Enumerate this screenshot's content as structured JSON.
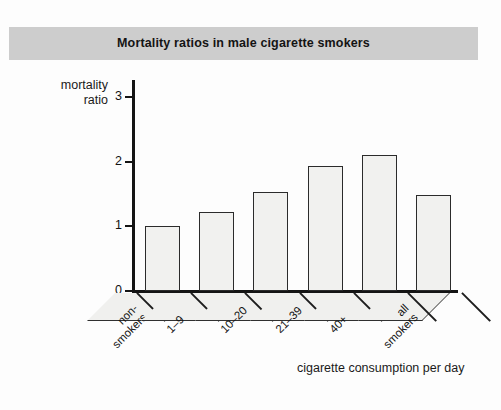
{
  "figure": {
    "title": "Mortality ratios in male cigarette smokers",
    "background_color": "#fdfdfd",
    "title_band_color": "#cdcdcd"
  },
  "chart_data": {
    "type": "bar",
    "title": "Mortality ratios in male cigarette smokers",
    "xlabel": "cigarette consumption per day",
    "ylabel": "mortality ratio",
    "categories": [
      "non-smokers",
      "1–9",
      "10–20",
      "21–39",
      "40+",
      "all smokers"
    ],
    "category_lines": [
      [
        "non-",
        "smokers"
      ],
      [
        "1–9"
      ],
      [
        "10–20"
      ],
      [
        "21–39"
      ],
      [
        "40+"
      ],
      [
        "all",
        "smokers"
      ]
    ],
    "values": [
      1.0,
      1.23,
      1.54,
      1.93,
      2.1,
      1.49
    ],
    "ylim": [
      0,
      3.2
    ],
    "yticks": [
      0,
      1,
      2,
      3
    ],
    "ytick_labels": [
      "0",
      "1",
      "2",
      "3"
    ],
    "grid": false,
    "legend": null,
    "bar_fill_color": "#f1f1ef",
    "bar_edge_color": "#2b2b2b",
    "axis_color": "#141414"
  },
  "y_axis": {
    "caption_lines": [
      "mortality",
      "ratio"
    ]
  },
  "x_axis": {
    "caption": "cigarette consumption per day"
  }
}
